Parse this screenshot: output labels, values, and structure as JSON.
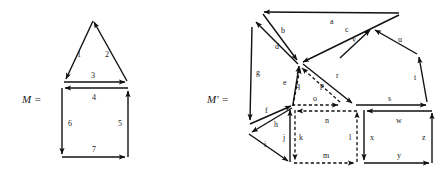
{
  "figure": {
    "type": "mathematical-diagram",
    "complexes": [
      {
        "id": "M",
        "label": "M =",
        "faces": [
          {
            "name": "triangle",
            "style": "solid",
            "edges": [
              "1",
              "2",
              "3"
            ]
          },
          {
            "name": "square",
            "style": "solid",
            "edges": [
              "4",
              "5",
              "6",
              "7"
            ]
          }
        ],
        "edge_labels": [
          "1",
          "2",
          "3",
          "4",
          "5",
          "6",
          "7"
        ]
      },
      {
        "id": "M-prime",
        "label": "M' =",
        "faces": [
          {
            "name": "upper-left-triangle",
            "style": "solid",
            "edges": [
              "a",
              "b",
              "d"
            ]
          },
          {
            "name": "upper-right-triangle",
            "style": "solid",
            "edges": [
              "a",
              "c",
              "v"
            ]
          },
          {
            "name": "left-quadrilateral",
            "style": "solid",
            "edges": [
              "d",
              "g",
              "f",
              "e"
            ]
          },
          {
            "name": "center-dashed-triangle",
            "style": "dashed",
            "edges": [
              "q",
              "p",
              "o"
            ]
          },
          {
            "name": "right-center-triangle",
            "style": "solid",
            "edges": [
              "c",
              "r",
              "s"
            ]
          },
          {
            "name": "pentagon",
            "style": "solid",
            "edges": [
              "v",
              "u",
              "t",
              "s",
              "r"
            ]
          },
          {
            "name": "small-left-triangle",
            "style": "solid",
            "edges": [
              "h",
              "i",
              "j"
            ]
          },
          {
            "name": "dashed-square",
            "style": "dashed",
            "edges": [
              "n",
              "l",
              "m",
              "k"
            ]
          },
          {
            "name": "right-square",
            "style": "solid",
            "edges": [
              "w",
              "z",
              "y",
              "x"
            ]
          }
        ],
        "edge_labels": [
          "a",
          "b",
          "c",
          "d",
          "e",
          "f",
          "g",
          "h",
          "i",
          "j",
          "k",
          "l",
          "m",
          "n",
          "o",
          "p",
          "q",
          "r",
          "s",
          "t",
          "u",
          "v",
          "w",
          "x",
          "y",
          "z"
        ]
      }
    ],
    "colors": {
      "stroke": "#111111",
      "text": "#1a1a1a",
      "background": "#ffffff"
    }
  },
  "labels": {
    "M": {
      "text": "M ="
    },
    "Mprime": {
      "text": "M' ="
    },
    "m1": "1",
    "m2": "2",
    "m3": "3",
    "m4": "4",
    "m5": "5",
    "m6": "6",
    "m7": "7",
    "a": "a",
    "b": "b",
    "c": "c",
    "d": "d",
    "e": "e",
    "f": "f",
    "g": "g",
    "h": "h",
    "i": "i",
    "j": "j",
    "k": "k",
    "l": "l",
    "m": "m",
    "n": "n",
    "o": "o",
    "p": "p",
    "q": "q",
    "r": "r",
    "s": "s",
    "t": "t",
    "u": "u",
    "v": "v",
    "w": "w",
    "x": "x",
    "y": "y",
    "z": "z"
  }
}
